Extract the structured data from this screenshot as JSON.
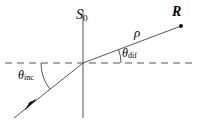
{
  "figure": {
    "type": "ray-diagram",
    "width": 199,
    "height": 124,
    "background_color": "#ffffff",
    "line_color": "#444444",
    "text_color": "#000000"
  },
  "labels": {
    "surface_plane": "S",
    "surface_plane_sub": "0",
    "observation_point": "R",
    "distance": "ρ",
    "angle_diffracted": "θ",
    "angle_diffracted_sub": "dif",
    "angle_incident": "θ",
    "angle_incident_sub": "inc"
  },
  "geometry": {
    "origin": {
      "x": 83,
      "y": 63
    },
    "vertical_line": {
      "x": 83,
      "y1": 10,
      "y2": 118,
      "style": "solid",
      "name": "S0 plane normal axis"
    },
    "dashed_axis": {
      "x1": 5,
      "y1": 63,
      "x2": 192,
      "y2": 63,
      "style": "dashed",
      "name": "horizontal reference axis"
    },
    "incident_ray": {
      "x1": 14,
      "y1": 118,
      "x2": 83,
      "y2": 63,
      "arrow_at": {
        "x": 31,
        "y": 104
      },
      "direction": "up-right"
    },
    "diffracted_ray": {
      "x1": 83,
      "y1": 63,
      "x2": 181,
      "y2": 26
    },
    "observation_dot": {
      "x": 181,
      "y": 26,
      "r": 2
    },
    "arc_incident": {
      "cx": 83,
      "cy": 63,
      "radius": 42,
      "from_deg": 180,
      "to_deg": 218
    },
    "arc_diffracted": {
      "cx": 83,
      "cy": 63,
      "radius": 38,
      "from_deg": 0,
      "to_deg": -21
    }
  }
}
